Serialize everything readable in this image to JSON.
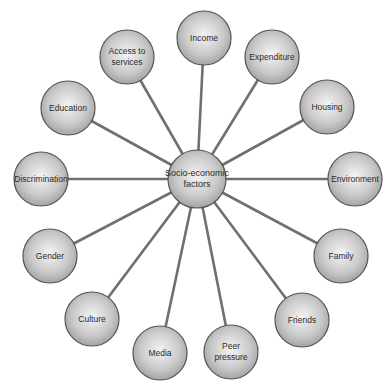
{
  "diagram": {
    "type": "hub-and-spoke",
    "center": {
      "label": "Socio-economic\nfactors",
      "x": 197,
      "y": 179,
      "r": 29
    },
    "nodes": [
      {
        "id": "income",
        "label": "Income",
        "x": 204,
        "y": 38
      },
      {
        "id": "expenditure",
        "label": "Expenditure",
        "x": 272,
        "y": 57
      },
      {
        "id": "housing",
        "label": "Housing",
        "x": 327,
        "y": 107
      },
      {
        "id": "environment",
        "label": "Environment",
        "x": 355,
        "y": 179
      },
      {
        "id": "family",
        "label": "Family",
        "x": 341,
        "y": 256
      },
      {
        "id": "friends",
        "label": "Friends",
        "x": 302,
        "y": 320
      },
      {
        "id": "peer-pressure",
        "label": "Peer\npressure",
        "x": 231,
        "y": 352
      },
      {
        "id": "media",
        "label": "Media",
        "x": 160,
        "y": 353
      },
      {
        "id": "culture",
        "label": "Culture",
        "x": 92,
        "y": 319
      },
      {
        "id": "gender",
        "label": "Gender",
        "x": 50,
        "y": 256
      },
      {
        "id": "discrimination",
        "label": "Discrimination",
        "x": 41,
        "y": 179
      },
      {
        "id": "education",
        "label": "Education",
        "x": 68,
        "y": 108
      },
      {
        "id": "access-to-services",
        "label": "Access to\nservices",
        "x": 127,
        "y": 57
      }
    ],
    "node_radius": 27,
    "colors": {
      "spoke": "#707070",
      "stroke": "#555555",
      "fill_light": "#f2f2f2",
      "fill_dark": "#9a9a9a"
    }
  }
}
